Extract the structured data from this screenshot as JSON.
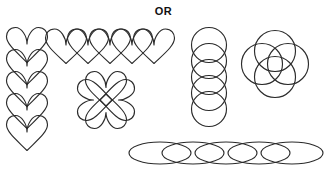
{
  "header": {
    "label": "OR"
  },
  "canvas": {
    "width": 327,
    "height": 172,
    "background_color": "#ffffff",
    "stroke_color": "#2b2b2b",
    "stroke_width": 1.15
  },
  "figures": [
    {
      "id": "heart-column",
      "name": "vertical-heart-column",
      "shape": "heart",
      "arrangement": "vertical-stack",
      "count": 5,
      "overlap": true,
      "x": 5,
      "y": 26,
      "width": 44,
      "height": 114,
      "unit_size": 30,
      "step": 22
    },
    {
      "id": "heart-row",
      "name": "horizontal-heart-row",
      "shape": "heart",
      "arrangement": "horizontal-row",
      "count": 5,
      "overlap": true,
      "x": 48,
      "y": 28,
      "width": 122,
      "height": 36,
      "unit_size": 32,
      "step": 22
    },
    {
      "id": "heart-clover",
      "name": "heart-clover-rosette",
      "shape": "heart",
      "arrangement": "rotational-rosette",
      "count": 4,
      "overlap": true,
      "x": 76,
      "y": 70,
      "width": 60,
      "height": 60,
      "unit_size": 34,
      "rotation_step_degrees": 90
    },
    {
      "id": "circle-column",
      "name": "vertical-circle-column",
      "shape": "circle",
      "arrangement": "vertical-stack",
      "count": 5,
      "overlap": true,
      "x": 190,
      "y": 27,
      "width": 38,
      "height": 97,
      "unit_size": 34,
      "step": 16
    },
    {
      "id": "circle-rosette",
      "name": "circle-rosette",
      "shape": "circle",
      "arrangement": "four-point-rosette",
      "count": 4,
      "overlap": true,
      "x": 240,
      "y": 29,
      "width": 72,
      "height": 70,
      "unit_size": 40,
      "offset": 13
    },
    {
      "id": "ellipse-row",
      "name": "horizontal-ellipse-row",
      "shape": "ellipse",
      "arrangement": "horizontal-row",
      "count": 5,
      "overlap": true,
      "x": 128,
      "y": 140,
      "width": 194,
      "height": 30,
      "unit_width": 62,
      "unit_height": 22,
      "step": 33
    }
  ]
}
